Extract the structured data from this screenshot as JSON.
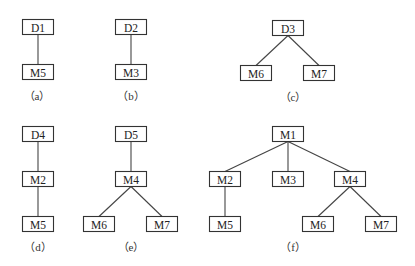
{
  "diagram": {
    "type": "tree-decomposition",
    "box_width": 31,
    "box_height": 15,
    "subfigures": [
      {
        "id": "a",
        "caption": "（a）",
        "caption_pos": [
          37,
          96
        ],
        "nodes": [
          {
            "id": "a_D1",
            "label": "D1",
            "x": 38,
            "y": 27
          },
          {
            "id": "a_M5",
            "label": "M5",
            "x": 38,
            "y": 72
          }
        ],
        "edges": [
          [
            "a_D1",
            "a_M5"
          ]
        ]
      },
      {
        "id": "b",
        "caption": "（b）",
        "caption_pos": [
          131,
          96
        ],
        "nodes": [
          {
            "id": "b_D2",
            "label": "D2",
            "x": 131,
            "y": 27
          },
          {
            "id": "b_M3",
            "label": "M3",
            "x": 131,
            "y": 72
          }
        ],
        "edges": [
          [
            "b_D2",
            "b_M3"
          ]
        ]
      },
      {
        "id": "c",
        "caption": "（c）",
        "caption_pos": [
          293,
          97
        ],
        "nodes": [
          {
            "id": "c_D3",
            "label": "D3",
            "x": 288,
            "y": 28
          },
          {
            "id": "c_M6",
            "label": "M6",
            "x": 256,
            "y": 73
          },
          {
            "id": "c_M7",
            "label": "M7",
            "x": 319,
            "y": 73
          }
        ],
        "edges": [
          [
            "c_D3",
            "c_M6"
          ],
          [
            "c_D3",
            "c_M7"
          ]
        ]
      },
      {
        "id": "d",
        "caption": "（d）",
        "caption_pos": [
          38,
          247
        ],
        "nodes": [
          {
            "id": "d_D4",
            "label": "D4",
            "x": 38,
            "y": 134
          },
          {
            "id": "d_M2",
            "label": "M2",
            "x": 38,
            "y": 179
          },
          {
            "id": "d_M5",
            "label": "M5",
            "x": 38,
            "y": 224
          }
        ],
        "edges": [
          [
            "d_D4",
            "d_M2"
          ],
          [
            "d_M2",
            "d_M5"
          ]
        ]
      },
      {
        "id": "e",
        "caption": "（e）",
        "caption_pos": [
          131,
          247
        ],
        "nodes": [
          {
            "id": "e_D5",
            "label": "D5",
            "x": 131,
            "y": 134
          },
          {
            "id": "e_M4",
            "label": "M4",
            "x": 131,
            "y": 179
          },
          {
            "id": "e_M6",
            "label": "M6",
            "x": 99,
            "y": 224
          },
          {
            "id": "e_M7",
            "label": "M7",
            "x": 162,
            "y": 224
          }
        ],
        "edges": [
          [
            "e_D5",
            "e_M4"
          ],
          [
            "e_M4",
            "e_M6"
          ],
          [
            "e_M4",
            "e_M7"
          ]
        ]
      },
      {
        "id": "f",
        "caption": "（f）",
        "caption_pos": [
          293,
          247
        ],
        "nodes": [
          {
            "id": "f_M1",
            "label": "M1",
            "x": 288,
            "y": 134
          },
          {
            "id": "f_M2",
            "label": "M2",
            "x": 225,
            "y": 179
          },
          {
            "id": "f_M3",
            "label": "M3",
            "x": 288,
            "y": 179
          },
          {
            "id": "f_M4",
            "label": "M4",
            "x": 350,
            "y": 179
          },
          {
            "id": "f_M5",
            "label": "M5",
            "x": 225,
            "y": 224
          },
          {
            "id": "f_M6",
            "label": "M6",
            "x": 318,
            "y": 224
          },
          {
            "id": "f_M7",
            "label": "M7",
            "x": 381,
            "y": 224
          }
        ],
        "edges": [
          [
            "f_M1",
            "f_M2"
          ],
          [
            "f_M1",
            "f_M3"
          ],
          [
            "f_M1",
            "f_M4"
          ],
          [
            "f_M2",
            "f_M5"
          ],
          [
            "f_M4",
            "f_M6"
          ],
          [
            "f_M4",
            "f_M7"
          ]
        ]
      }
    ]
  }
}
